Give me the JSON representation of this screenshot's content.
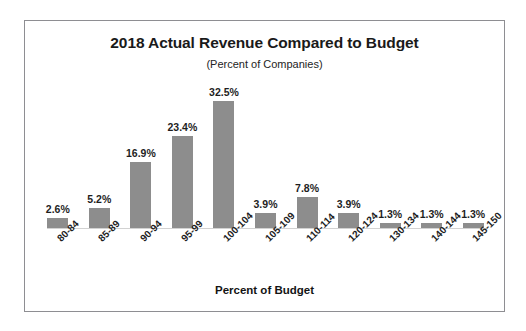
{
  "chart_data": {
    "type": "bar",
    "title": "2018 Actual Revenue Compared to Budget",
    "subtitle": "(Percent of Companies)",
    "xlabel": "Percent of Budget",
    "ylabel": "",
    "ylim": [
      0,
      35
    ],
    "grid": false,
    "legend": null,
    "bar_color": "#8d8d8d",
    "categories": [
      "80-84",
      "85-89",
      "90-94",
      "95-99",
      "100-104",
      "105-109",
      "110-114",
      "120-124",
      "130-134",
      "140-144",
      "145-150"
    ],
    "values": [
      2.6,
      5.2,
      16.9,
      23.4,
      32.5,
      3.9,
      7.8,
      3.9,
      1.3,
      1.3,
      1.3
    ],
    "value_labels": [
      "2.6%",
      "5.2%",
      "16.9%",
      "23.4%",
      "32.5%",
      "3.9%",
      "7.8%",
      "3.9%",
      "1.3%",
      "1.3%",
      "1.3%"
    ]
  },
  "frame": {
    "border_color": "#8e8e92",
    "background": "#ffffff"
  }
}
